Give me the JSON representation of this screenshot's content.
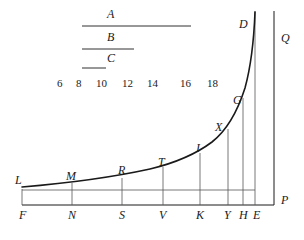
{
  "figure": {
    "background_color": "#ffffff",
    "stroke_color": "#1a1a1a",
    "curve_color": "#1a1a1a",
    "thin_line_color": "#555555"
  },
  "top_bracket": {
    "rows": [
      {
        "label": "A",
        "label_x": 107,
        "label_y": 8,
        "rule_x1": 82,
        "rule_x2": 191,
        "rule_y": 26
      },
      {
        "label": "B",
        "label_x": 107,
        "label_y": 31,
        "rule_x1": 82,
        "rule_x2": 134,
        "rule_y": 49
      },
      {
        "label": "C",
        "label_x": 107,
        "label_y": 52,
        "rule_x1": 82,
        "rule_x2": 106,
        "rule_y": 68
      }
    ]
  },
  "scale_numbers": {
    "y": 78,
    "items": [
      {
        "value": "6",
        "x": 57
      },
      {
        "value": "8",
        "x": 76
      },
      {
        "value": "10",
        "x": 96
      },
      {
        "value": "12",
        "x": 122
      },
      {
        "value": "14",
        "x": 147
      },
      {
        "value": "16",
        "x": 180
      },
      {
        "value": "18",
        "x": 207
      }
    ]
  },
  "axes": {
    "baseline": {
      "x1": 22,
      "x2": 274,
      "y": 205
    },
    "left_vertical": {
      "x": 22,
      "y1": 189,
      "y2": 205
    },
    "right_vertical_Q": {
      "x": 274,
      "y1": 11,
      "y2": 205
    },
    "asymptote_E": {
      "x": 255,
      "y1": 11,
      "y2": 205
    },
    "base_rule": {
      "x1": 22,
      "x2": 255,
      "y": 190
    }
  },
  "curve": {
    "description": "Monotone increasing convex curve from L at left to D near the top right",
    "path": "M 22 187 C 70 183, 118 176, 150 169 C 175 163, 196 154, 212 142 C 226 131, 237 113, 245 88 C 251 66, 254 38, 255 12"
  },
  "ordinates": [
    {
      "name": "ordinate-N",
      "x": 72,
      "y_top": 183,
      "y_bottom": 205
    },
    {
      "name": "ordinate-S",
      "x": 122,
      "y_top": 178,
      "y_bottom": 205
    },
    {
      "name": "ordinate-V",
      "x": 163,
      "y_top": 167,
      "y_bottom": 205
    },
    {
      "name": "ordinate-K",
      "x": 200,
      "y_top": 153,
      "y_bottom": 205
    },
    {
      "name": "ordinate-Y",
      "x": 228,
      "y_top": 129,
      "y_bottom": 205
    },
    {
      "name": "ordinate-H",
      "x": 243,
      "y_top": 98,
      "y_bottom": 205
    }
  ],
  "curve_point_labels": [
    {
      "id": "L",
      "text": "L",
      "x": 15,
      "y": 174
    },
    {
      "id": "M",
      "text": "M",
      "x": 66,
      "y": 170
    },
    {
      "id": "R",
      "text": "R",
      "x": 118,
      "y": 164
    },
    {
      "id": "T",
      "text": "T",
      "x": 158,
      "y": 156
    },
    {
      "id": "I",
      "text": "I",
      "x": 196,
      "y": 142
    },
    {
      "id": "X",
      "text": "X",
      "x": 215,
      "y": 121
    },
    {
      "id": "G",
      "text": "G",
      "x": 233,
      "y": 94
    },
    {
      "id": "D",
      "text": "D",
      "x": 239,
      "y": 18
    }
  ],
  "base_point_labels": [
    {
      "id": "F",
      "text": "F",
      "x": 19,
      "y": 209
    },
    {
      "id": "N",
      "text": "N",
      "x": 68,
      "y": 209
    },
    {
      "id": "S",
      "text": "S",
      "x": 119,
      "y": 209
    },
    {
      "id": "V",
      "text": "V",
      "x": 159,
      "y": 209
    },
    {
      "id": "K",
      "text": "K",
      "x": 196,
      "y": 209
    },
    {
      "id": "Y",
      "text": "Y",
      "x": 224,
      "y": 209
    },
    {
      "id": "H",
      "text": "H",
      "x": 239,
      "y": 209
    },
    {
      "id": "E",
      "text": "E",
      "x": 253,
      "y": 209
    }
  ],
  "axis_end_labels": [
    {
      "id": "Q",
      "text": "Q",
      "x": 281,
      "y": 32
    },
    {
      "id": "P",
      "text": "P",
      "x": 281,
      "y": 194
    }
  ]
}
